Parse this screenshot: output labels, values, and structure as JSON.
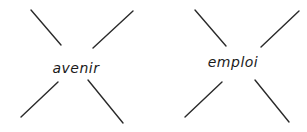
{
  "diagram": {
    "type": "word-cross-exercise",
    "stroke_color": "#2a2a2a",
    "text_color": "#1a1a1a",
    "items": [
      {
        "word": "avenir",
        "center": [
          76,
          68
        ],
        "lines": [
          {
            "from": [
              31,
              10
            ],
            "to": [
              61,
              45
            ]
          },
          {
            "from": [
              133,
              11
            ],
            "to": [
              93,
              48
            ]
          },
          {
            "from": [
              21,
              117
            ],
            "to": [
              58,
              82
            ]
          },
          {
            "from": [
              88,
              80
            ],
            "to": [
              123,
              123
            ]
          }
        ]
      },
      {
        "word": "emploi",
        "center": [
          233,
          62
        ],
        "lines": [
          {
            "from": [
              195,
              10
            ],
            "to": [
              226,
              46
            ]
          },
          {
            "from": [
              299,
              11
            ],
            "to": [
              261,
              47
            ]
          },
          {
            "from": [
              185,
              117
            ],
            "to": [
              222,
              82
            ]
          },
          {
            "from": [
              255,
              80
            ],
            "to": [
              289,
              122
            ]
          }
        ]
      }
    ]
  }
}
